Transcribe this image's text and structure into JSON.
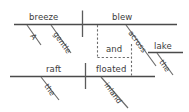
{
  "diagram": {
    "type": "reed-kellogg-sentence-diagram",
    "sentence": "A gentle breeze blew across the lake and the raft floated inland.",
    "ink_color": "#4a4a4a",
    "text_color": "#3b3b3b",
    "background_color": "#ffffff",
    "clauses": [
      {
        "name": "upper-clause",
        "subject": "breeze",
        "verb": "blew",
        "subject_modifiers": [
          "A",
          "gentle"
        ],
        "prepositional_phrase": {
          "preposition": "across",
          "object": "lake",
          "object_modifier": "the"
        }
      },
      {
        "name": "lower-clause",
        "subject": "raft",
        "verb": "floated",
        "subject_modifiers": [
          "the"
        ],
        "adverb": "inland"
      }
    ],
    "conjunction": "and"
  },
  "words": {
    "a": "A",
    "gentle": "gentle",
    "breeze": "breeze",
    "blew": "blew",
    "across": "across",
    "the_upper": "the",
    "lake": "lake",
    "and": "and",
    "the_lower": "the",
    "raft": "raft",
    "floated": "floated",
    "inland": "inland"
  }
}
